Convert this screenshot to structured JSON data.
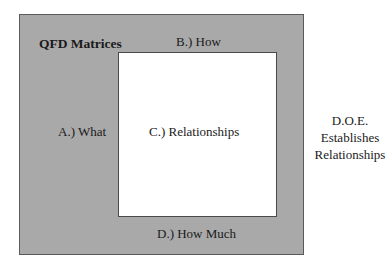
{
  "diagram": {
    "title": "QFD Matrices",
    "sections": {
      "a": "A.) What",
      "b": "B.) How",
      "c": "C.) Relationships",
      "d": "D.) How Much"
    },
    "side_note": {
      "line1": "D.O.E.",
      "line2": "Establishes",
      "line3": "Relationships"
    },
    "colors": {
      "frame": "#a9a9a9",
      "relationships_area": "#ffffff"
    }
  }
}
